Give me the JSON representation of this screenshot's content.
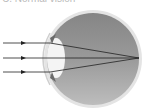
{
  "diagram": {
    "label": "C. Normal vision",
    "rays": [
      {
        "y": 43,
        "direction": "right"
      },
      {
        "y": 58,
        "direction": "right"
      },
      {
        "y": 72,
        "direction": "right"
      }
    ],
    "focal_point": {
      "x": 139,
      "y": 58
    },
    "colors": {
      "sclera": "#d9d9d9",
      "vitreous_top": "#8a8a8a",
      "vitreous_bottom": "#b0b0b0",
      "lens": "#f2f2f2",
      "ray": "#222222"
    }
  }
}
